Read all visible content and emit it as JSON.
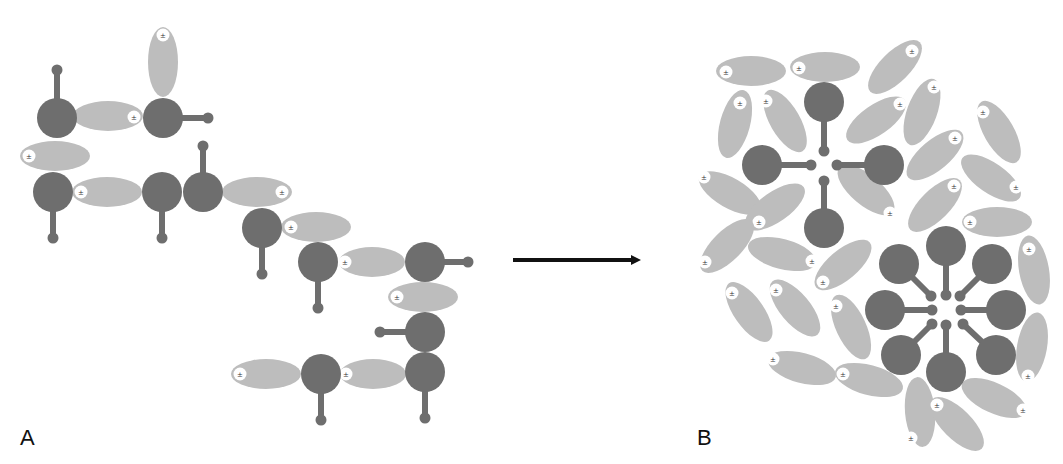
{
  "figure": {
    "panels": [
      {
        "id": "A",
        "label": "A",
        "description": "Individual amphiphilic/ionic molecules dispersed in solution"
      },
      {
        "id": "B",
        "label": "B",
        "description": "Molecules self-assembled into clustered aggregates (micelle-like)"
      }
    ],
    "arrow": {
      "from": "A",
      "to": "B",
      "x1": 513,
      "y1": 260,
      "x2": 643,
      "y2": 260,
      "color": "#111111"
    },
    "colors": {
      "head": "#6e6e6e",
      "tail": "#6e6e6e",
      "counterion": "#bdbdbd",
      "ion_marker_fill": "#ffffff",
      "ion_marker_glyph": "#333333",
      "background": "#ffffff"
    },
    "ion_glyph": "±",
    "panel_a": {
      "heads": [
        {
          "cx": 57,
          "cy": 118,
          "r": 20,
          "tail": [
            57,
            70
          ]
        },
        {
          "cx": 163,
          "cy": 118,
          "r": 20,
          "tail": [
            208,
            118
          ]
        },
        {
          "cx": 53,
          "cy": 192,
          "r": 20,
          "tail": [
            53,
            238
          ]
        },
        {
          "cx": 162,
          "cy": 192,
          "r": 20,
          "tail": [
            162,
            238
          ]
        },
        {
          "cx": 203,
          "cy": 192,
          "r": 20,
          "tail": [
            203,
            146
          ]
        },
        {
          "cx": 262,
          "cy": 228,
          "r": 20,
          "tail": [
            262,
            274
          ]
        },
        {
          "cx": 318,
          "cy": 262,
          "r": 20,
          "tail": [
            318,
            308
          ]
        },
        {
          "cx": 425,
          "cy": 262,
          "r": 20,
          "tail": [
            468,
            262
          ]
        },
        {
          "cx": 425,
          "cy": 332,
          "r": 20,
          "tail": [
            380,
            332
          ]
        },
        {
          "cx": 321,
          "cy": 374,
          "r": 20,
          "tail": [
            321,
            420
          ]
        },
        {
          "cx": 425,
          "cy": 372,
          "r": 20,
          "tail": [
            425,
            418
          ]
        }
      ],
      "ions": [
        {
          "cx": 163,
          "cy": 62,
          "rx": 15,
          "ry": 35,
          "angle": 0,
          "mx": 163,
          "my": 35
        },
        {
          "cx": 108,
          "cy": 116,
          "rx": 35,
          "ry": 15,
          "angle": 0,
          "mx": 134,
          "my": 117
        },
        {
          "cx": 55,
          "cy": 156,
          "rx": 35,
          "ry": 15,
          "angle": 0,
          "mx": 29,
          "my": 156
        },
        {
          "cx": 107,
          "cy": 192,
          "rx": 35,
          "ry": 15,
          "angle": 0,
          "mx": 81,
          "my": 192
        },
        {
          "cx": 257,
          "cy": 192,
          "rx": 35,
          "ry": 15,
          "angle": 0,
          "mx": 282,
          "my": 192
        },
        {
          "cx": 316,
          "cy": 227,
          "rx": 35,
          "ry": 15,
          "angle": 0,
          "mx": 291,
          "my": 227
        },
        {
          "cx": 372,
          "cy": 262,
          "rx": 33,
          "ry": 15,
          "angle": 0,
          "mx": 345,
          "my": 262
        },
        {
          "cx": 423,
          "cy": 297,
          "rx": 35,
          "ry": 15,
          "angle": 0,
          "mx": 397,
          "my": 297
        },
        {
          "cx": 266,
          "cy": 374,
          "rx": 35,
          "ry": 15,
          "angle": 0,
          "mx": 240,
          "my": 374
        },
        {
          "cx": 373,
          "cy": 374,
          "rx": 33,
          "ry": 15,
          "angle": 0,
          "mx": 346,
          "my": 374
        }
      ]
    },
    "panel_b": {
      "heads": [
        {
          "cx": 824,
          "cy": 102,
          "r": 20,
          "tail": [
            824,
            151
          ]
        },
        {
          "cx": 762,
          "cy": 165,
          "r": 20,
          "tail": [
            811,
            165
          ]
        },
        {
          "cx": 884,
          "cy": 165,
          "r": 20,
          "tail": [
            837,
            165
          ]
        },
        {
          "cx": 824,
          "cy": 228,
          "r": 20,
          "tail": [
            824,
            181
          ]
        },
        {
          "cx": 946,
          "cy": 246,
          "r": 20,
          "tail": [
            946,
            295
          ]
        },
        {
          "cx": 899,
          "cy": 264,
          "r": 20,
          "tail": [
            931,
            296
          ]
        },
        {
          "cx": 992,
          "cy": 264,
          "r": 20,
          "tail": [
            960,
            296
          ]
        },
        {
          "cx": 885,
          "cy": 310,
          "r": 20,
          "tail": [
            932,
            310
          ]
        },
        {
          "cx": 1006,
          "cy": 310,
          "r": 20,
          "tail": [
            961,
            310
          ]
        },
        {
          "cx": 901,
          "cy": 355,
          "r": 20,
          "tail": [
            932,
            324
          ]
        },
        {
          "cx": 996,
          "cy": 355,
          "r": 20,
          "tail": [
            963,
            324
          ]
        },
        {
          "cx": 946,
          "cy": 372,
          "r": 20,
          "tail": [
            946,
            325
          ]
        }
      ],
      "ions": [
        {
          "cx": 751,
          "cy": 71,
          "rx": 35,
          "ry": 15,
          "angle": 0,
          "mx": 726,
          "my": 72
        },
        {
          "cx": 825,
          "cy": 67,
          "rx": 35,
          "ry": 15,
          "angle": 0,
          "mx": 799,
          "my": 68
        },
        {
          "cx": 895,
          "cy": 67,
          "rx": 35,
          "ry": 15,
          "angle": -45,
          "mx": 912,
          "my": 51
        },
        {
          "cx": 735,
          "cy": 124,
          "rx": 35,
          "ry": 15,
          "angle": -75,
          "mx": 740,
          "my": 103
        },
        {
          "cx": 785,
          "cy": 121,
          "rx": 35,
          "ry": 15,
          "angle": 60,
          "mx": 766,
          "my": 101
        },
        {
          "cx": 876,
          "cy": 120,
          "rx": 35,
          "ry": 15,
          "angle": -35,
          "mx": 900,
          "my": 104
        },
        {
          "cx": 922,
          "cy": 112,
          "rx": 35,
          "ry": 15,
          "angle": -70,
          "mx": 934,
          "my": 87
        },
        {
          "cx": 999,
          "cy": 132,
          "rx": 35,
          "ry": 15,
          "angle": 60,
          "mx": 983,
          "my": 112
        },
        {
          "cx": 935,
          "cy": 155,
          "rx": 35,
          "ry": 15,
          "angle": -40,
          "mx": 955,
          "my": 138
        },
        {
          "cx": 991,
          "cy": 178,
          "rx": 35,
          "ry": 15,
          "angle": 35,
          "mx": 1016,
          "my": 187
        },
        {
          "cx": 730,
          "cy": 193,
          "rx": 35,
          "ry": 15,
          "angle": 30,
          "mx": 704,
          "my": 177
        },
        {
          "cx": 775,
          "cy": 207,
          "rx": 35,
          "ry": 15,
          "angle": -35,
          "mx": 759,
          "my": 222
        },
        {
          "cx": 866,
          "cy": 190,
          "rx": 35,
          "ry": 15,
          "angle": 40,
          "mx": 890,
          "my": 213
        },
        {
          "cx": 935,
          "cy": 205,
          "rx": 35,
          "ry": 15,
          "angle": -45,
          "mx": 954,
          "my": 186
        },
        {
          "cx": 997,
          "cy": 222,
          "rx": 35,
          "ry": 15,
          "angle": 0,
          "mx": 970,
          "my": 222
        },
        {
          "cx": 727,
          "cy": 246,
          "rx": 35,
          "ry": 15,
          "angle": -45,
          "mx": 705,
          "my": 262
        },
        {
          "cx": 782,
          "cy": 254,
          "rx": 35,
          "ry": 15,
          "angle": 15,
          "mx": 812,
          "my": 261
        },
        {
          "cx": 843,
          "cy": 265,
          "rx": 35,
          "ry": 15,
          "angle": -40,
          "mx": 823,
          "my": 282
        },
        {
          "cx": 1034,
          "cy": 270,
          "rx": 35,
          "ry": 15,
          "angle": 80,
          "mx": 1029,
          "my": 249
        },
        {
          "cx": 749,
          "cy": 312,
          "rx": 35,
          "ry": 15,
          "angle": 55,
          "mx": 732,
          "my": 293
        },
        {
          "cx": 795,
          "cy": 308,
          "rx": 35,
          "ry": 15,
          "angle": 50,
          "mx": 776,
          "my": 290
        },
        {
          "cx": 851,
          "cy": 327,
          "rx": 35,
          "ry": 15,
          "angle": 65,
          "mx": 836,
          "my": 306
        },
        {
          "cx": 1032,
          "cy": 347,
          "rx": 35,
          "ry": 15,
          "angle": -80,
          "mx": 1028,
          "my": 376
        },
        {
          "cx": 802,
          "cy": 368,
          "rx": 35,
          "ry": 15,
          "angle": 15,
          "mx": 773,
          "my": 359
        },
        {
          "cx": 869,
          "cy": 380,
          "rx": 35,
          "ry": 15,
          "angle": 15,
          "mx": 843,
          "my": 374
        },
        {
          "cx": 994,
          "cy": 398,
          "rx": 35,
          "ry": 15,
          "angle": 25,
          "mx": 1023,
          "my": 410
        },
        {
          "cx": 920,
          "cy": 412,
          "rx": 35,
          "ry": 15,
          "angle": 85,
          "mx": 911,
          "my": 438
        },
        {
          "cx": 957,
          "cy": 424,
          "rx": 35,
          "ry": 15,
          "angle": 45,
          "mx": 937,
          "my": 405
        }
      ]
    }
  }
}
